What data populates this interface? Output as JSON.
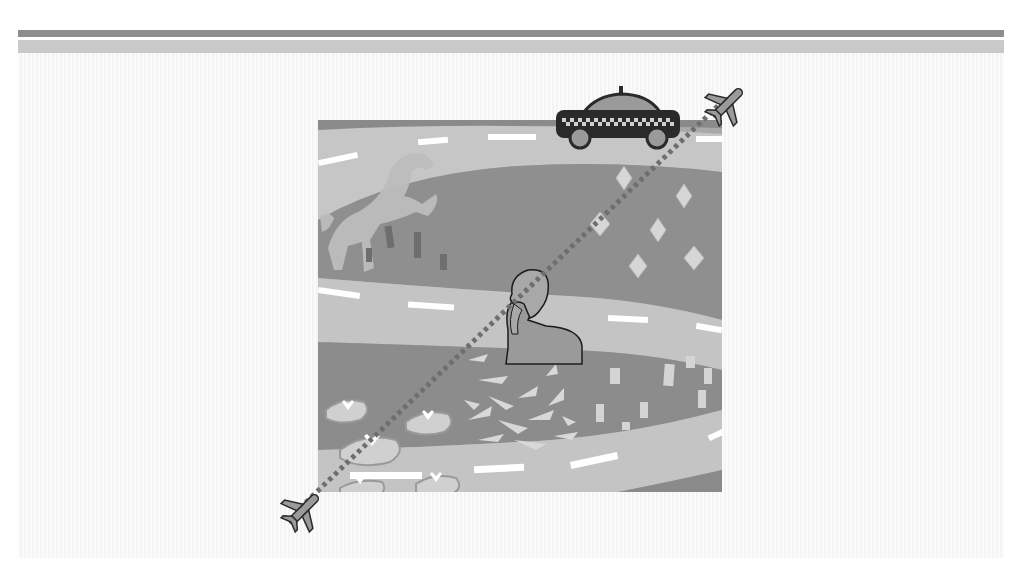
{
  "illustration": {
    "description": "Grayscale illustration of a winding road with a taxi, a rearing horse, a person talking on a phone, leaf and arrow patterns, and a dotted flight path between two airplanes",
    "colors": {
      "background": "#ffffff",
      "bar_dark": "#8e8e8e",
      "bar_light": "#c9c9c9",
      "road": "#c4c4c4",
      "field": "#8f8f8f",
      "lane_marking": "#ffffff",
      "taxi_body": "#2a2a2a",
      "flight_path": "#6e6e6e"
    },
    "icons": [
      "airplane-icon",
      "taxi-icon",
      "horse-icon",
      "person-phone-icon",
      "airplane-icon"
    ]
  }
}
